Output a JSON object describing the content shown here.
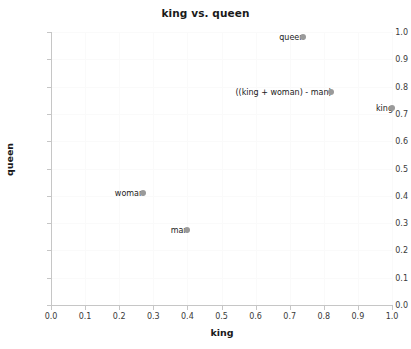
{
  "chart_data": {
    "type": "scatter",
    "title": "king vs. queen",
    "xlabel": "king",
    "ylabel": "queen",
    "xlim": [
      0.0,
      1.0
    ],
    "ylim": [
      0.0,
      1.0
    ],
    "grid": true,
    "legend": "none",
    "xticks": [
      "0.0",
      "0.1",
      "0.2",
      "0.3",
      "0.4",
      "0.5",
      "0.6",
      "0.7",
      "0.8",
      "0.9",
      "1.0"
    ],
    "yticks": [
      "0.0",
      "0.1",
      "0.2",
      "0.3",
      "0.4",
      "0.5",
      "0.6",
      "0.7",
      "0.8",
      "0.9",
      "1.0"
    ],
    "xtick_values": [
      0.0,
      0.1,
      0.2,
      0.3,
      0.4,
      0.5,
      0.6,
      0.7,
      0.8,
      0.9,
      1.0
    ],
    "ytick_values": [
      0.0,
      0.1,
      0.2,
      0.3,
      0.4,
      0.5,
      0.6,
      0.7,
      0.8,
      0.9,
      1.0
    ],
    "marker_color": "#9a9a9a",
    "points": [
      {
        "label": "queen",
        "x": 0.74,
        "y": 0.98
      },
      {
        "label": "((king + woman) - man)",
        "x": 0.82,
        "y": 0.78
      },
      {
        "label": "king",
        "x": 1.0,
        "y": 0.72
      },
      {
        "label": "woman",
        "x": 0.27,
        "y": 0.41
      },
      {
        "label": "man",
        "x": 0.4,
        "y": 0.275
      }
    ]
  },
  "colors": {
    "background": "#ffffff",
    "axis": "#c6c6c6",
    "grid": "#fafafa",
    "text": "#1a1a1a",
    "tick_text": "#3a3a3a",
    "marker": "#9a9a9a"
  }
}
